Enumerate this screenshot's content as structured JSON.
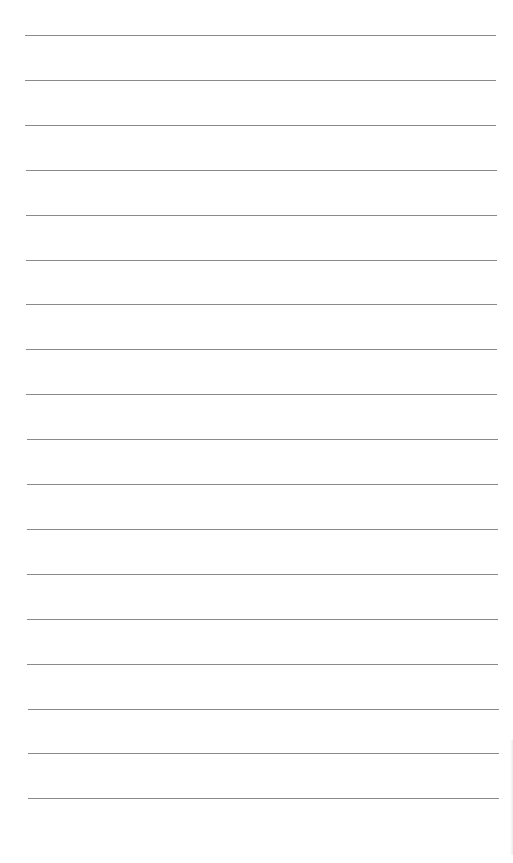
{
  "page": {
    "type": "lined-paper",
    "background": "#ffffff",
    "line_color": "#8a8a8a",
    "line_count": 18,
    "first_line_y": 35,
    "line_spacing": 44.9,
    "line_left_x": 25,
    "line_right_x": 496,
    "lines": [
      {
        "index": 1,
        "text": ""
      },
      {
        "index": 2,
        "text": ""
      },
      {
        "index": 3,
        "text": ""
      },
      {
        "index": 4,
        "text": ""
      },
      {
        "index": 5,
        "text": ""
      },
      {
        "index": 6,
        "text": ""
      },
      {
        "index": 7,
        "text": ""
      },
      {
        "index": 8,
        "text": ""
      },
      {
        "index": 9,
        "text": ""
      },
      {
        "index": 10,
        "text": ""
      },
      {
        "index": 11,
        "text": ""
      },
      {
        "index": 12,
        "text": ""
      },
      {
        "index": 13,
        "text": ""
      },
      {
        "index": 14,
        "text": ""
      },
      {
        "index": 15,
        "text": ""
      },
      {
        "index": 16,
        "text": ""
      },
      {
        "index": 17,
        "text": ""
      },
      {
        "index": 18,
        "text": ""
      }
    ]
  }
}
